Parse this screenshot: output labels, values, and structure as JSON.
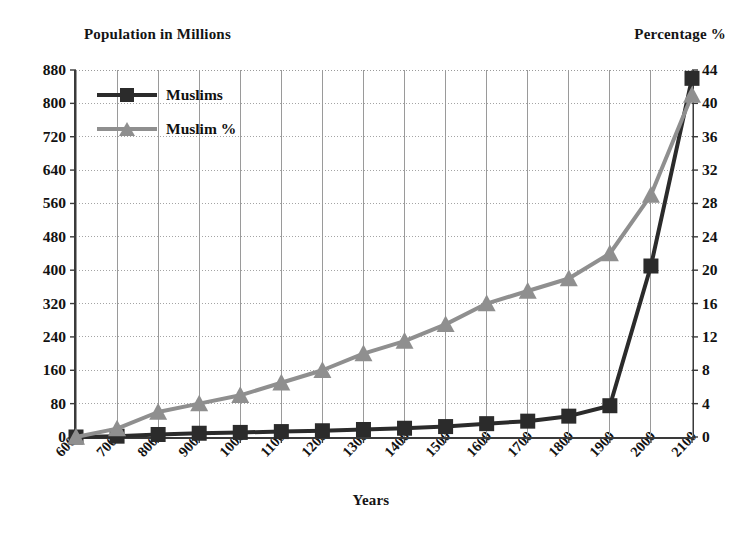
{
  "chart_data": {
    "type": "line",
    "title": "",
    "xlabel": "Years",
    "ylabel": "Population in Millions",
    "y2label": "Percentage %",
    "x": [
      600,
      700,
      800,
      900,
      1000,
      1100,
      1200,
      1300,
      1400,
      1500,
      1600,
      1700,
      1800,
      1900,
      2000,
      2100
    ],
    "categories": [
      "600",
      "700",
      "800",
      "900",
      "1000",
      "1100",
      "1200",
      "1300",
      "1400",
      "1500",
      "1600",
      "1700",
      "1800",
      "1900",
      "2000",
      "2100"
    ],
    "series": [
      {
        "name": "Muslims",
        "axis": "left",
        "unit": "millions",
        "color": "#2b2b2b",
        "marker": "square",
        "values": [
          0,
          2,
          6,
          9,
          11,
          13,
          15,
          18,
          21,
          25,
          32,
          38,
          50,
          75,
          410,
          860
        ]
      },
      {
        "name": "Muslim %",
        "axis": "right",
        "unit": "percent",
        "color": "#8f8f8f",
        "marker": "triangle",
        "values": [
          0,
          1,
          3,
          4,
          5,
          6.5,
          8,
          10,
          11.5,
          13.5,
          16,
          17.5,
          19,
          22,
          29,
          41
        ]
      }
    ],
    "ylim": [
      0,
      880
    ],
    "yticks": [
      0,
      80,
      160,
      240,
      320,
      400,
      480,
      560,
      640,
      720,
      800,
      880
    ],
    "y2lim": [
      0,
      44
    ],
    "y2ticks": [
      0,
      4,
      8,
      12,
      16,
      20,
      24,
      28,
      32,
      36,
      40,
      44
    ],
    "grid": true,
    "legend_position": "top-left",
    "legend": [
      "Muslims",
      "Muslim %"
    ]
  },
  "axes": {
    "left_title": "Population in Millions",
    "right_title": "Percentage %",
    "x_title": "Years"
  },
  "legend": {
    "items": [
      {
        "label": "Muslims",
        "color": "#2b2b2b",
        "marker": "square"
      },
      {
        "label": "Muslim %",
        "color": "#8f8f8f",
        "marker": "triangle"
      }
    ]
  },
  "colors": {
    "series_muslims": "#2b2b2b",
    "series_muslim_percent": "#8f8f8f",
    "grid": "#9a9a9a",
    "axis": "#3a3a3a",
    "background": "#ffffff"
  }
}
